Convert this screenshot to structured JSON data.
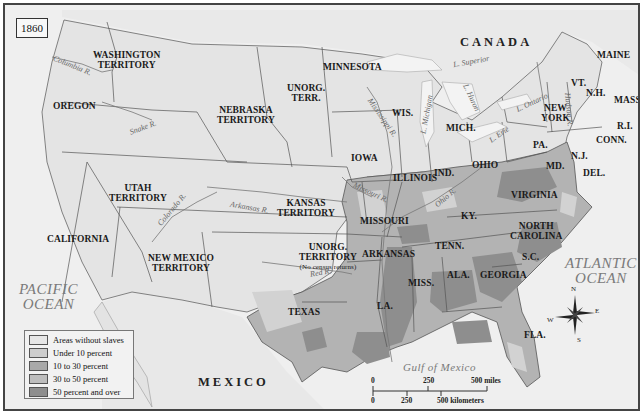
{
  "map": {
    "year": "1860",
    "colors": {
      "water": "#f1f1f1",
      "land_no_slaves": "#e6e6e6",
      "under_10": "#cdcdcd",
      "10_to_30": "#a9a9a9",
      "30_to_50": "#bdbdbd",
      "50_and_over": "#8e8e8e",
      "border": "#555555"
    },
    "countries": {
      "canada": "CANADA",
      "mexico": "MEXICO"
    },
    "oceans": {
      "pacific": [
        "PACIFIC",
        "OCEAN"
      ],
      "atlantic": [
        "ATLANTIC",
        "OCEAN"
      ],
      "gulf": "Gulf of Mexico"
    },
    "regions": {
      "washington": [
        "WASHINGTON",
        "TERRITORY"
      ],
      "oregon": "OREGON",
      "california": "CALIFORNIA",
      "utah": [
        "UTAH",
        "TERRITORY"
      ],
      "new_mexico": [
        "NEW MEXICO",
        "TERRITORY"
      ],
      "nebraska": [
        "NEBRASKA",
        "TERRITORY"
      ],
      "unorg_terr_north": [
        "UNORG.",
        "TERR."
      ],
      "kansas": [
        "KANSAS",
        "TERRITORY"
      ],
      "unorg_territory_south": [
        "UNORG.",
        "TERRITORY",
        "(No census returns)"
      ],
      "texas": "TEXAS",
      "minnesota": "MINNESOTA",
      "iowa": "IOWA",
      "missouri": "MISSOURI",
      "arkansas": "ARKANSAS",
      "louisiana": "LA.",
      "wisconsin": "WIS.",
      "illinois": "ILLINOIS",
      "michigan": "MICH.",
      "indiana": "IND.",
      "ohio": "OHIO",
      "kentucky": "KY.",
      "tennessee": "TENN.",
      "mississippi": "MISS.",
      "alabama": "ALA.",
      "georgia": "GEORGIA",
      "florida": "FLA.",
      "south_carolina": "S.C.",
      "north_carolina": [
        "NORTH",
        "CAROLINA"
      ],
      "virginia": "VIRGINIA",
      "maryland": "MD.",
      "delaware": "DEL.",
      "new_jersey": "N.J.",
      "pennsylvania": "PA.",
      "new_york": [
        "NEW",
        "YORK"
      ],
      "vermont": "VT.",
      "new_hampshire": "N.H.",
      "maine": "MAINE",
      "massachusetts": "MASS.",
      "rhode_island": "R.I.",
      "connecticut": "CONN."
    },
    "rivers": {
      "columbia": "Columbia R.",
      "snake": "Snake R.",
      "colorado": "Colorado R.",
      "arkansas": "Arkansas R.",
      "red": "Red R.",
      "missouri": "Missouri R.",
      "mississippi": "Mississippi R.",
      "ohio": "Ohio R.",
      "hudson": "Hudson R."
    },
    "lakes": {
      "superior": "L. Superior",
      "michigan": "L. Michigan",
      "huron": "L. Huron",
      "erie": "L. Erie",
      "ontario": "L. Ontario"
    },
    "legend": [
      {
        "label": "Areas without slaves",
        "color": "#e6e6e6"
      },
      {
        "label": "Under 10 percent",
        "color": "#cdcdcd"
      },
      {
        "label": "10 to 30 percent",
        "color": "#a9a9a9"
      },
      {
        "label": "30 to 50 percent",
        "color": "#bdbdbd"
      },
      {
        "label": "50 percent and over",
        "color": "#8e8e8e"
      }
    ],
    "scale": {
      "miles": [
        "0",
        "250",
        "500 miles"
      ],
      "kilometers": [
        "0",
        "250",
        "500 kilometers"
      ]
    },
    "compass": {
      "n": "N",
      "s": "S",
      "e": "E",
      "w": "W"
    }
  }
}
